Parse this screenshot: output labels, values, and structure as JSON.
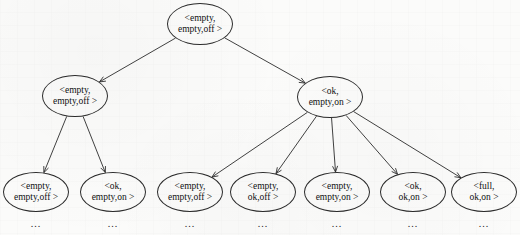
{
  "diagram": {
    "type": "tree",
    "title": "",
    "node_shape": "ellipse",
    "edge_style": "straight-line-with-arrowhead",
    "stroke_color": "#2b2b2b",
    "background_color": "#fbfbfa",
    "ellipsis_label": "...",
    "levels": 3,
    "nodes": [
      {
        "id": "root",
        "level": 0,
        "line1": "<empty,",
        "line2": "empty,off >",
        "cx": 200,
        "cy": 24,
        "rx": 33,
        "ry": 21,
        "font_size": 9.5,
        "has_ellipsis": false
      },
      {
        "id": "l1a",
        "level": 1,
        "line1": "<empty,",
        "line2": "empty,off >",
        "cx": 75,
        "cy": 96,
        "rx": 33,
        "ry": 21,
        "font_size": 9.5,
        "has_ellipsis": false
      },
      {
        "id": "l1b",
        "level": 1,
        "line1": "<ok,",
        "line2": "empty,on >",
        "cx": 330,
        "cy": 97,
        "rx": 33,
        "ry": 21,
        "font_size": 9.5,
        "has_ellipsis": false
      },
      {
        "id": "l2a",
        "level": 2,
        "line1": "<empty,",
        "line2": "empty,off >",
        "cx": 36,
        "cy": 192,
        "rx": 33,
        "ry": 20,
        "font_size": 9.5,
        "has_ellipsis": true
      },
      {
        "id": "l2b",
        "level": 2,
        "line1": "<ok,",
        "line2": "empty,on >",
        "cx": 113,
        "cy": 192,
        "rx": 33,
        "ry": 20,
        "font_size": 9.5,
        "has_ellipsis": true
      },
      {
        "id": "l2c",
        "level": 2,
        "line1": "<empty,",
        "line2": "empty,off >",
        "cx": 190,
        "cy": 192,
        "rx": 33,
        "ry": 20,
        "font_size": 9.5,
        "has_ellipsis": true
      },
      {
        "id": "l2d",
        "level": 2,
        "line1": "<empty,",
        "line2": "ok,off >",
        "cx": 263,
        "cy": 192,
        "rx": 33,
        "ry": 20,
        "font_size": 9.5,
        "has_ellipsis": true
      },
      {
        "id": "l2e",
        "level": 2,
        "line1": "<empty,",
        "line2": "empty,on >",
        "cx": 337,
        "cy": 192,
        "rx": 33,
        "ry": 20,
        "font_size": 9.5,
        "has_ellipsis": true
      },
      {
        "id": "l2f",
        "level": 2,
        "line1": "<ok,",
        "line2": "ok,on >",
        "cx": 413,
        "cy": 192,
        "rx": 33,
        "ry": 20,
        "font_size": 9.5,
        "has_ellipsis": true
      },
      {
        "id": "l2g",
        "level": 2,
        "line1": "<full,",
        "line2": "ok,on >",
        "cx": 484,
        "cy": 192,
        "rx": 33,
        "ry": 20,
        "font_size": 9.5,
        "has_ellipsis": true
      }
    ],
    "edges": [
      {
        "from": "root",
        "to": "l1a"
      },
      {
        "from": "root",
        "to": "l1b"
      },
      {
        "from": "l1a",
        "to": "l2a"
      },
      {
        "from": "l1a",
        "to": "l2b"
      },
      {
        "from": "l1b",
        "to": "l2c"
      },
      {
        "from": "l1b",
        "to": "l2d"
      },
      {
        "from": "l1b",
        "to": "l2e"
      },
      {
        "from": "l1b",
        "to": "l2f"
      },
      {
        "from": "l1b",
        "to": "l2g"
      }
    ]
  }
}
